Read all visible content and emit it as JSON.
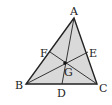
{
  "diagram": {
    "colors": {
      "fill": "#d9d9d9",
      "stroke": "#222222",
      "background": "#ffffff"
    },
    "vertices": {
      "A": {
        "label": "A",
        "x": 74,
        "y": 18
      },
      "B": {
        "label": "B",
        "x": 26,
        "y": 84
      },
      "C": {
        "label": "C",
        "x": 97,
        "y": 84
      }
    },
    "midpoints": {
      "D": {
        "label": "D",
        "x": 62,
        "y": 84,
        "on": "BC"
      },
      "E": {
        "label": "E",
        "x": 88,
        "y": 52,
        "on": "AC"
      },
      "F": {
        "label": "F",
        "x": 50,
        "y": 52,
        "on": "AB"
      }
    },
    "centroid": {
      "label": "G",
      "x": 65,
      "y": 63
    },
    "segments": [
      "AB",
      "BC",
      "CA",
      "AD",
      "BE",
      "CF"
    ]
  }
}
